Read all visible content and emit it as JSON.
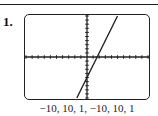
{
  "exercise_number": "1.",
  "window_label": "−10, 10, 1, −10, 10, 1",
  "chart_data": {
    "type": "line",
    "title": "",
    "xlabel": "",
    "ylabel": "",
    "xlim": [
      -10,
      10
    ],
    "ylim": [
      -10,
      10
    ],
    "xscale": 1,
    "yscale": 1,
    "grid": false,
    "tick_marks": true,
    "series": [
      {
        "name": "y = 3x - 5",
        "x": [
          -1.67,
          5
        ],
        "y": [
          -10,
          10
        ]
      }
    ],
    "x_intercept": 1.67,
    "y_intercept": -5
  },
  "colors": {
    "axis": "#222222",
    "line": "#222222",
    "frame": "#222222"
  }
}
